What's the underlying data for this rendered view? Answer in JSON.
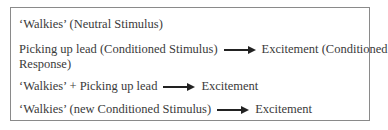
{
  "diagram": {
    "lines": [
      {
        "text": "‘Walkies’ (Neutral Stimulus)"
      },
      {
        "left": "Picking up lead (Conditioned Stimulus)",
        "right": "Excitement (Conditioned",
        "continuation": "Response)"
      },
      {
        "left": "‘Walkies’ + Picking up lead",
        "right": "Excitement"
      },
      {
        "left": "‘Walkies’ (new Conditioned Stimulus)",
        "right": "Excitement"
      }
    ]
  }
}
